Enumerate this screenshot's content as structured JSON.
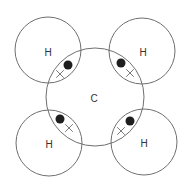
{
  "diagram": {
    "colors": {
      "outline": "#6f6f6f",
      "dot": "#1e1e1e",
      "cross": "#7a7a7a",
      "label": "#333333"
    },
    "central_atom": {
      "label": "C",
      "cx": 95,
      "cy": 97,
      "r": 49,
      "label_x": 94,
      "label_y": 98
    },
    "outer_atoms": [
      {
        "label": "H",
        "position": "top-left",
        "cx": 48,
        "cy": 50,
        "r": 33,
        "label_x": 48,
        "label_y": 52,
        "dot": {
          "x": 68,
          "y": 65
        },
        "cross": {
          "x": 60,
          "y": 74
        }
      },
      {
        "label": "H",
        "position": "top-right",
        "cx": 142,
        "cy": 51,
        "r": 33,
        "label_x": 143,
        "label_y": 52,
        "dot": {
          "x": 121,
          "y": 63
        },
        "cross": {
          "x": 130,
          "y": 73
        }
      },
      {
        "label": "H",
        "position": "bottom-left",
        "cx": 49,
        "cy": 143,
        "r": 33,
        "label_x": 49,
        "label_y": 144,
        "dot": {
          "x": 60,
          "y": 119
        },
        "cross": {
          "x": 69,
          "y": 128
        }
      },
      {
        "label": "H",
        "position": "bottom-right",
        "cx": 144,
        "cy": 142,
        "r": 33,
        "label_x": 144,
        "label_y": 143,
        "dot": {
          "x": 130,
          "y": 121
        },
        "cross": {
          "x": 121,
          "y": 131
        }
      }
    ],
    "legend_symbols": {
      "dot": "electron from hydrogen",
      "cross": "electron from carbon"
    }
  }
}
